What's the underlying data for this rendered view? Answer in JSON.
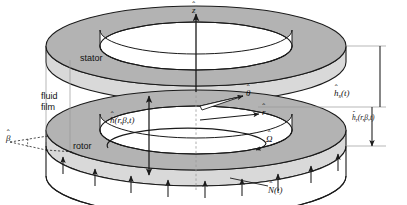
{
  "figure": {
    "kind": "thrust-bearing-schematic",
    "background_color": "#ffffff",
    "ring_fill_color": "#b3b3b3",
    "line_color": "#1a1a1a"
  },
  "labels": {
    "stator": "stator",
    "rotor": "rotor",
    "fluid_film_line1": "fluid",
    "fluid_film_line2": "film"
  },
  "symbols": {
    "z_axis": {
      "base": "z",
      "sub": "",
      "args": ""
    },
    "r_axis": {
      "base": "r",
      "sub": "",
      "args": ""
    },
    "theta_axis": {
      "base": "θ",
      "sub": "",
      "args": ""
    },
    "omega": {
      "base": "Ω",
      "sub": "",
      "args": ""
    },
    "beta": {
      "base": "β",
      "sub": "",
      "args": ""
    },
    "film_thickness": {
      "base": "h",
      "sub": "",
      "args": "(r,β,t)"
    },
    "stator_height": {
      "base": "h",
      "sub": "s",
      "args": "(t)"
    },
    "rotor_height": {
      "base": "h",
      "sub": "r",
      "args": "(r,β,t)"
    },
    "load": {
      "base": "N",
      "sub": "",
      "args": "(t)"
    }
  },
  "annotations": {
    "film_thickness_text": "h(r, β, t)",
    "stator_height_text": "h_s(t)",
    "rotor_height_text": "h_r(r, β, t)",
    "load_text": "N(t)",
    "omega_text": "Ω",
    "beta_text": "β",
    "z_text": "z",
    "r_text": "r",
    "theta_text": "θ"
  },
  "geometry": {
    "stator": {
      "cx": 196,
      "cy": 62,
      "rx_outer": 150,
      "ry_outer": 40,
      "rx_inner": 96,
      "ry_inner": 24,
      "thickness": 16
    },
    "rotor": {
      "cx": 196,
      "cy": 146,
      "rx_outer": 150,
      "ry_outer": 40,
      "rx_inner": 96,
      "ry_inner": 24,
      "thickness": 16
    },
    "load_arrow_count": 9
  }
}
